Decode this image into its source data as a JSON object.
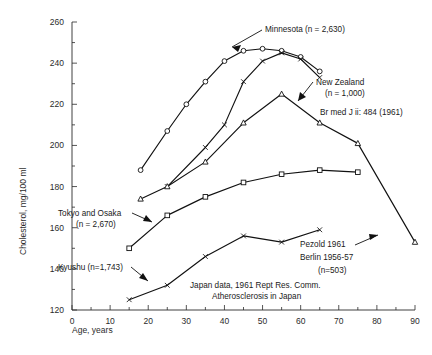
{
  "chart_data": {
    "type": "line",
    "title": "",
    "xlabel": "Age, years",
    "ylabel": "Cholesterol, mg/100 ml",
    "xlim": [
      0,
      90
    ],
    "ylim": [
      120,
      260
    ],
    "x_ticks": [
      0,
      10,
      20,
      30,
      40,
      50,
      60,
      70,
      80,
      90
    ],
    "y_ticks": [
      120,
      140,
      160,
      180,
      200,
      220,
      240,
      260
    ],
    "x_minor_step": 5,
    "y_minor_step": 10,
    "grid": false,
    "legend_position": "inline-annotations",
    "series": [
      {
        "name": "Minnesota",
        "label": "Minnesota (n = 2,630)",
        "marker": "open-circle",
        "x": [
          18,
          25,
          30,
          35,
          40,
          45,
          50,
          55,
          60,
          65
        ],
        "values": [
          188,
          207,
          220,
          231,
          241,
          246,
          247,
          246,
          243,
          236
        ]
      },
      {
        "name": "New Zealand",
        "label": "New Zealand (n = 1,000)",
        "marker": "cross",
        "x": [
          25,
          35,
          40,
          45,
          50,
          55,
          60,
          65
        ],
        "values": [
          180,
          199,
          210,
          231,
          241,
          245,
          242,
          233
        ]
      },
      {
        "name": "Pezold Berlin",
        "label": "Pezold 1961 Berlin 1956-57 (n = 503)",
        "marker": "open-triangle",
        "x": [
          18,
          25,
          35,
          45,
          55,
          65,
          75,
          90
        ],
        "values": [
          174,
          180,
          192,
          211,
          225,
          211,
          201,
          153
        ]
      },
      {
        "name": "Tokyo and Osaka",
        "label": "Tokyo and Osaka (n = 2,670)",
        "marker": "open-square",
        "x": [
          15,
          25,
          35,
          45,
          55,
          65,
          75
        ],
        "values": [
          150,
          166,
          175,
          182,
          186,
          188,
          187
        ]
      },
      {
        "name": "Kyushu",
        "label": "Kyushu (n = 1,743)",
        "marker": "cross",
        "x": [
          15,
          25,
          35,
          45,
          55,
          65
        ],
        "values": [
          125,
          132,
          146,
          156,
          153,
          159
        ]
      }
    ],
    "annotations": [
      {
        "id": "minnesota",
        "text": "Minnesota (n = 2,630)"
      },
      {
        "id": "new-zealand-line1",
        "text": "New Zealand"
      },
      {
        "id": "new-zealand-line2",
        "text": "(n = 1,000)"
      },
      {
        "id": "citation-brmedj",
        "text": "Br med J ii: 484 (1961)"
      },
      {
        "id": "tokyo-osaka-line1",
        "text": "Tokyo and Osaka"
      },
      {
        "id": "tokyo-osaka-line2",
        "text": "(n = 2,670)"
      },
      {
        "id": "kyushu",
        "text": "Kyushu (n=1,743)"
      },
      {
        "id": "pezold-line1",
        "text": "Pezold 1961"
      },
      {
        "id": "pezold-line2",
        "text": "Berlin 1956-57"
      },
      {
        "id": "pezold-line3",
        "text": "(n=503)"
      },
      {
        "id": "japan-source-line1",
        "text": "Japan data, 1961 Rept Res. Comm."
      },
      {
        "id": "japan-source-line2",
        "text": "Atherosclerosis in Japan"
      }
    ]
  },
  "axes": {
    "x_label": "Age, years",
    "y_label": "Cholesterol, mg/100 ml",
    "x_tick_labels": [
      "0",
      "10",
      "20",
      "30",
      "40",
      "50",
      "60",
      "70",
      "80",
      "90"
    ],
    "y_tick_labels": [
      "120",
      "140",
      "160",
      "180",
      "200",
      "220",
      "240",
      "260"
    ]
  },
  "colors": {
    "ink": "#111111",
    "axis": "#2b2b2b",
    "background": "#ffffff"
  }
}
